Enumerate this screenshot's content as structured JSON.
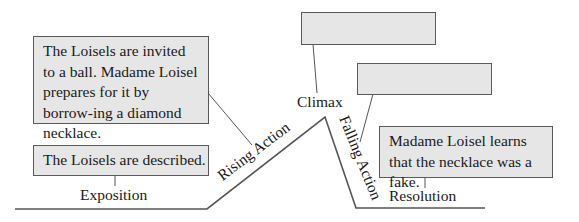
{
  "diagram": {
    "type": "plot-diagram",
    "stages": [
      {
        "id": "exposition",
        "label": "Exposition",
        "box_text": "The Loisels are described."
      },
      {
        "id": "rising_action",
        "label": "Rising Action",
        "box_text": "The Loisels are invited to a ball. Madame Loisel prepares for it by borrow-ing a diamond necklace."
      },
      {
        "id": "climax",
        "label": "Climax",
        "box_text": ""
      },
      {
        "id": "falling_action",
        "label": "Falling Action",
        "box_text": ""
      },
      {
        "id": "resolution",
        "label": "Resolution",
        "box_text": "Madame Loisel learns that the necklace was a fake."
      }
    ],
    "colors": {
      "box_fill": "#e6e6e6",
      "box_border": "#5a5a5a",
      "line": "#555555"
    }
  }
}
